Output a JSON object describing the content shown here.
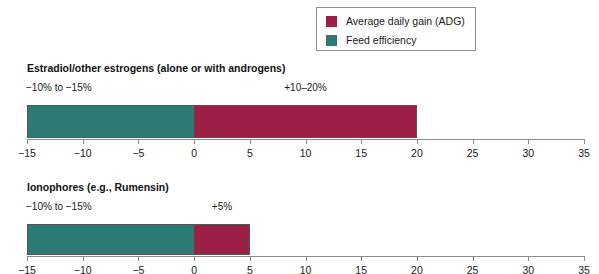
{
  "legend": {
    "items": [
      {
        "label": "Average daily gain (ADG)",
        "color": "#9c1f45",
        "key": "adg"
      },
      {
        "label": "Feed efficiency",
        "color": "#2e7a75",
        "key": "fe"
      }
    ]
  },
  "chart_data": {
    "type": "bar",
    "orientation": "horizontal",
    "title": "",
    "xlabel": "",
    "ylabel": "",
    "xlim": [
      -15,
      35
    ],
    "xticks": [
      -15,
      -10,
      -5,
      0,
      5,
      10,
      15,
      20,
      25,
      30,
      35
    ],
    "xtick_labels": [
      "−15",
      "−10",
      "−5",
      "0",
      "5",
      "10",
      "15",
      "20",
      "25",
      "30",
      "35"
    ],
    "grid": false,
    "legend_position": "top-right",
    "series": [
      {
        "name": "Feed efficiency",
        "color": "#2e7a75"
      },
      {
        "name": "Average daily gain (ADG)",
        "color": "#9c1f45"
      }
    ],
    "panels": [
      {
        "title": "Estradiol/other estrogens (alone or with androgens)",
        "feed_efficiency": {
          "value": -15,
          "annotation": "−10% to −15%"
        },
        "adg": {
          "value": 20,
          "annotation": "+10–20%"
        }
      },
      {
        "title": "Ionophores (e.g., Rumensin)",
        "feed_efficiency": {
          "value": -15,
          "annotation": "−10% to −15%"
        },
        "adg": {
          "value": 5,
          "annotation": "+5%"
        }
      }
    ]
  }
}
